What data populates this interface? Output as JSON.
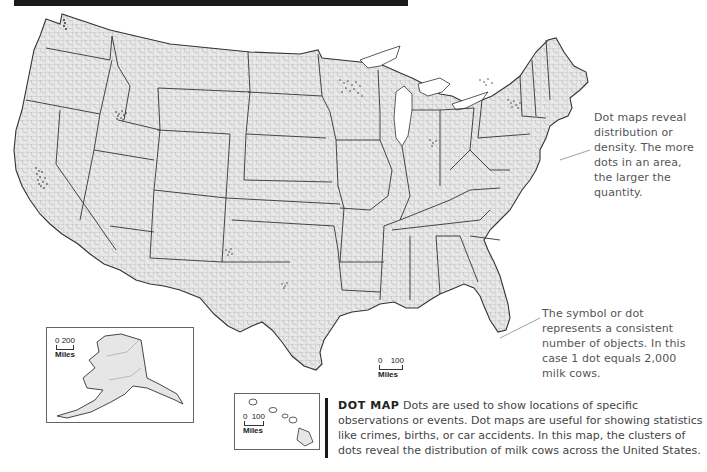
{
  "header": {
    "bar_color": "#1a1a1a"
  },
  "map": {
    "subject": "Dot map of milk cows across the United States",
    "land_fill": "#e6e6e6",
    "state_border": "#333333",
    "county_border": "#9a9a9a",
    "dot_color": "#222222"
  },
  "annotations": {
    "density_note": "Dot maps reveal distribution or density. The more dots in an area, the larger the quantity.",
    "symbol_note": "The symbol or dot represents a consistent number of objects. In this case 1 dot equals 2,000 milk cows."
  },
  "scales": {
    "mainland": {
      "start": "0",
      "end": "100",
      "unit": "Miles"
    },
    "alaska": {
      "start": "0",
      "end": "200",
      "unit": "Miles"
    },
    "hawaii": {
      "start": "0",
      "end": "100",
      "unit": "Miles"
    }
  },
  "caption": {
    "title": "DOT MAP",
    "body": " Dots are used to show locations of specific observations or events. Dot maps are useful for showing statistics like crimes, births, or car accidents. In this map, the clusters of dots reveal the distribution of milk cows across the United States."
  },
  "legend": {
    "dot_value": "1 dot = 2,000 milk cows"
  }
}
